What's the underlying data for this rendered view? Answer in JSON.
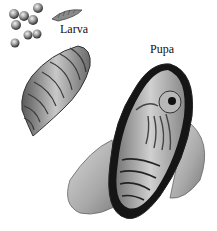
{
  "illustration": {
    "subject": "insect life stages",
    "labels": {
      "larva": "Larva",
      "pupa": "Pupa"
    },
    "elements": [
      "eggs",
      "small-larva",
      "larva",
      "pupa-cocoon-cutaway",
      "cocoon"
    ]
  }
}
